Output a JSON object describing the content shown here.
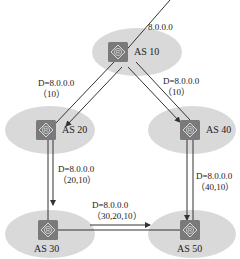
{
  "diagram": {
    "type": "bgp-as-path-propagation",
    "colors": {
      "as_ellipse": "#d9d9d9",
      "router_box": "#7a7a7a",
      "router_glyph": "#d8d8d8",
      "line": "#333333"
    },
    "nodes": [
      {
        "id": "as10",
        "label": "AS 10",
        "icon": "router-icon"
      },
      {
        "id": "as20",
        "label": "AS 20",
        "icon": "router-icon"
      },
      {
        "id": "as30",
        "label": "AS 30",
        "icon": "router-icon"
      },
      {
        "id": "as40",
        "label": "AS 40",
        "icon": "router-icon"
      },
      {
        "id": "as50",
        "label": "AS 50",
        "icon": "router-icon"
      }
    ],
    "origin_prefix": "8.0.0.0",
    "edges": [
      {
        "from": "as10",
        "to": "as20",
        "dest": "D=8.0.0.0",
        "path": "（10）"
      },
      {
        "from": "as10",
        "to": "as40",
        "dest": "D=8.0.0.0",
        "path": "（10）"
      },
      {
        "from": "as20",
        "to": "as30",
        "dest": "D=8.0.0.0",
        "path": "（20,10）"
      },
      {
        "from": "as40",
        "to": "as50",
        "dest": "D=8.0.0.0",
        "path": "（40,10）"
      },
      {
        "from": "as30",
        "to": "as50",
        "dest": "D=8.0.0.0",
        "path": "（30,20,10）"
      }
    ],
    "router_glyph": "R"
  }
}
